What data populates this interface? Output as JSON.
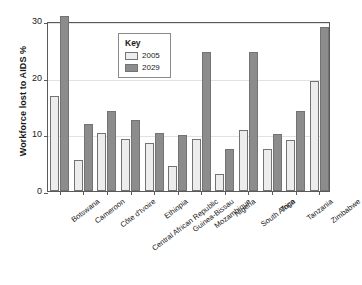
{
  "chart_data": {
    "type": "bar",
    "title": "",
    "xlabel": "",
    "ylabel": "Workforce lost to AIDS %",
    "ylim": [
      0,
      30
    ],
    "yticks": [
      0,
      10,
      20,
      30
    ],
    "grid": true,
    "legend_position": "upper-left-inside",
    "legend_title": "Key",
    "categories": [
      "Botswana",
      "Cameroon",
      "Côte d'Ivoire",
      "Central African Republic",
      "Ethiopia",
      "Guinea-Bissau",
      "Mozambique",
      "Nigeria",
      "South Africa",
      "Togo",
      "Tanzania",
      "Zimbabwe"
    ],
    "series": [
      {
        "name": "2005",
        "color": "#ededed",
        "values": [
          16.8,
          5.5,
          10.2,
          9.2,
          8.4,
          4.4,
          9.2,
          3.0,
          10.8,
          7.4,
          9.0,
          19.5
        ]
      },
      {
        "name": "2029",
        "color": "#8c8c8c",
        "values": [
          30.8,
          11.8,
          14.1,
          12.6,
          10.3,
          9.9,
          24.5,
          7.4,
          24.6,
          10.1,
          14.2,
          29.0
        ]
      }
    ]
  },
  "axis": {
    "y_title": "Workforce lost to AIDS %",
    "y_tick_labels": [
      "0",
      "10",
      "20",
      "30"
    ]
  },
  "legend": {
    "title": "Key",
    "entries": [
      {
        "label": "2005",
        "color": "#ededed"
      },
      {
        "label": "2029",
        "color": "#8c8c8c"
      }
    ]
  },
  "colors": {
    "series_2005": "#ededed",
    "series_2029": "#8c8c8c",
    "bar_border": "#737373",
    "axis": "#5a5a5a",
    "grid": "#e2e2e2",
    "text": "#1a1a1a",
    "background": "#ffffff"
  }
}
